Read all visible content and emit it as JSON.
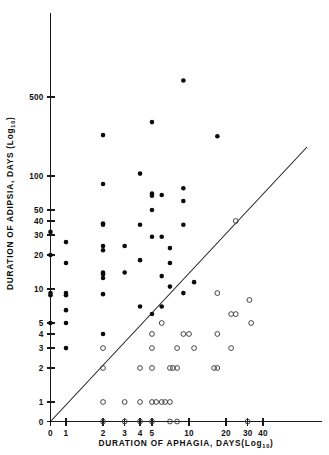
{
  "chart_data": {
    "type": "scatter",
    "title": "",
    "xlabel": "DURATION OF APHAGIA, DAYS(Log10)",
    "xlabel_main": "DURATION  OF  APHAGIA,  DAYS(",
    "xlabel_log": "Log",
    "xlabel_sub": "10",
    "xlabel_close": ")",
    "ylabel": "DURATION OF ADIPSIA, DAYS (Log10)",
    "ylabel_main": "DURATION  OF  ADIPSIA,  DAYS (",
    "ylabel_log": "Log",
    "ylabel_sub": "10",
    "ylabel_close": ")",
    "x_scale": "log10",
    "y_scale": "log10",
    "grid": false,
    "legend": false,
    "xticks": [
      0,
      1,
      2,
      3,
      4,
      5,
      10,
      20,
      30,
      40
    ],
    "xtick_labels": [
      "0",
      "1",
      "2",
      "3",
      "4",
      "5",
      "10",
      "20",
      "30",
      "40"
    ],
    "yticks": [
      0,
      1,
      2,
      3,
      4,
      5,
      10,
      20,
      30,
      40,
      50,
      100,
      500
    ],
    "ytick_labels": [
      "0",
      "1",
      "2",
      "3",
      "4",
      "5",
      "10",
      "20",
      "30",
      "40",
      "50",
      "100",
      "500"
    ],
    "xlim": [
      0,
      60
    ],
    "ylim": [
      0,
      700
    ],
    "reference_line": {
      "name": "identity-line",
      "description": "line of equality y = x",
      "from": [
        0,
        0
      ],
      "to": [
        38,
        38
      ]
    },
    "series": [
      {
        "name": "adipsia-exceeds-aphagia",
        "marker": "filled-circle",
        "color": "#0b0b0b",
        "points": [
          [
            9,
            700
          ],
          [
            5,
            300
          ],
          [
            2,
            230
          ],
          [
            17,
            225
          ],
          [
            4,
            105
          ],
          [
            2,
            85
          ],
          [
            5,
            70
          ],
          [
            5,
            67
          ],
          [
            9,
            78
          ],
          [
            6,
            68
          ],
          [
            9,
            60
          ],
          [
            5,
            50
          ],
          [
            2,
            38
          ],
          [
            2,
            37
          ],
          [
            4,
            37
          ],
          [
            9,
            37
          ],
          [
            0,
            32
          ],
          [
            5,
            29
          ],
          [
            6,
            29
          ],
          [
            1,
            26
          ],
          [
            2,
            24
          ],
          [
            2,
            22
          ],
          [
            3,
            24
          ],
          [
            0,
            20
          ],
          [
            7,
            23
          ],
          [
            1,
            17
          ],
          [
            4,
            18
          ],
          [
            7,
            17
          ],
          [
            2,
            14
          ],
          [
            2,
            13.5
          ],
          [
            2,
            12.5
          ],
          [
            3,
            14
          ],
          [
            6,
            13
          ],
          [
            0,
            9.2
          ],
          [
            0,
            8.8
          ],
          [
            2,
            9
          ],
          [
            7,
            10.5
          ],
          [
            9,
            9.2
          ],
          [
            11,
            11.5
          ],
          [
            1,
            9.2
          ],
          [
            1,
            8.8
          ],
          [
            1,
            6.5
          ],
          [
            4,
            7
          ],
          [
            6,
            7
          ],
          [
            0,
            5
          ],
          [
            1,
            5
          ],
          [
            5,
            6
          ],
          [
            2,
            4
          ],
          [
            1,
            3
          ]
        ]
      },
      {
        "name": "aphagia-exceeds-adipsia",
        "marker": "open-circle",
        "color": "#3c3c3c",
        "points": [
          [
            17,
            9.2
          ],
          [
            31,
            8
          ],
          [
            22,
            6
          ],
          [
            24,
            6
          ],
          [
            24,
            40
          ],
          [
            32,
            5
          ],
          [
            6,
            5
          ],
          [
            5,
            4
          ],
          [
            9,
            4
          ],
          [
            10,
            4
          ],
          [
            17,
            4
          ],
          [
            2,
            3
          ],
          [
            5,
            3
          ],
          [
            8,
            3
          ],
          [
            11,
            3
          ],
          [
            22,
            3
          ],
          [
            2,
            2
          ],
          [
            4,
            2
          ],
          [
            5,
            2
          ],
          [
            7,
            2
          ],
          [
            7.4,
            2
          ],
          [
            8,
            2
          ],
          [
            16,
            2
          ],
          [
            17,
            2
          ],
          [
            2,
            1
          ],
          [
            3,
            1
          ],
          [
            4,
            1
          ],
          [
            5,
            1
          ],
          [
            5.4,
            1
          ],
          [
            6,
            1
          ],
          [
            6.4,
            1
          ],
          [
            7,
            1
          ],
          [
            2,
            0
          ],
          [
            3,
            0
          ],
          [
            4,
            0
          ],
          [
            5,
            0
          ],
          [
            7,
            0
          ],
          [
            8,
            0
          ],
          [
            30,
            0
          ]
        ]
      }
    ]
  }
}
